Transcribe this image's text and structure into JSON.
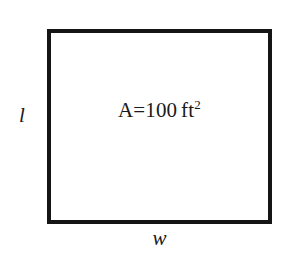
{
  "diagram": {
    "type": "geometry-rectangle-area",
    "background_color": "#ffffff",
    "stroke_color": "#151515",
    "text_color": "#1a1a1a",
    "shape": {
      "name": "rectangle",
      "x": 47,
      "y": 29,
      "width": 225,
      "height": 195,
      "border_width": 4
    },
    "area_annotation": {
      "variable": "A",
      "operator": "=",
      "value": "100",
      "unit": "ft",
      "unit_exponent": "2",
      "full_text": "A=100 ft2"
    },
    "labels": {
      "length": "l",
      "width": "w"
    }
  }
}
